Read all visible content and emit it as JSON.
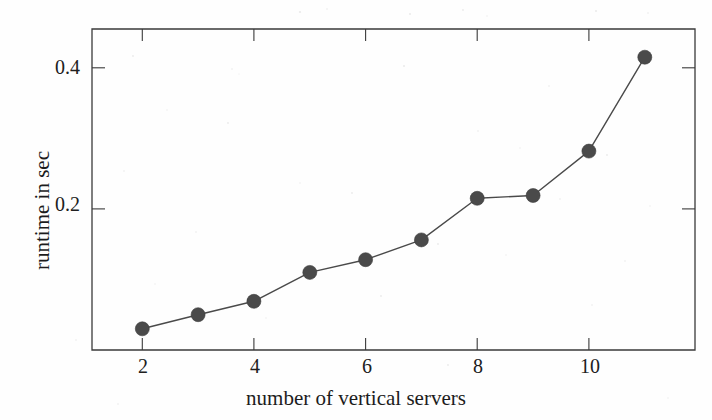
{
  "chart_data": {
    "type": "line",
    "title": "",
    "subtitle": "",
    "xlabel": "number of vertical servers",
    "ylabel": "runtime in sec",
    "x": [
      2,
      3,
      4,
      5,
      6,
      7,
      8,
      9,
      10,
      11
    ],
    "values": [
      0.03,
      0.05,
      0.069,
      0.11,
      0.128,
      0.156,
      0.215,
      0.219,
      0.282,
      0.415
    ],
    "series": [
      {
        "name": "runtime",
        "values": [
          0.03,
          0.05,
          0.069,
          0.11,
          0.128,
          0.156,
          0.215,
          0.219,
          0.282,
          0.415
        ]
      }
    ],
    "xlim": [
      1.1,
      11.9
    ],
    "ylim": [
      0.0,
      0.455
    ],
    "xticks": [
      2,
      4,
      6,
      8,
      10
    ],
    "xtick_labels": [
      "2",
      "4",
      "6",
      "8",
      "10"
    ],
    "yticks": [
      0.2,
      0.4
    ],
    "ytick_labels": [
      "0.2",
      "0.4"
    ],
    "grid": false,
    "legend": null,
    "legend_position": "none",
    "annotations": [],
    "marker": "filled-circle",
    "marker_color": "#4a4a4a",
    "line_color": "#4a4a4a",
    "axis_color": "#3a3a3a",
    "background_color": "#ffffff",
    "ticks_mirrored": true,
    "tick_direction": "in"
  }
}
